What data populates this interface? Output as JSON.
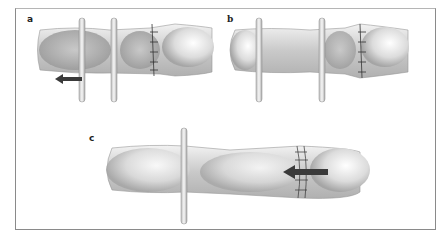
{
  "figure": {
    "panels": [
      {
        "id": "a",
        "label": "a",
        "description": "Finger with sutured junction at right; two vertical retractors on left; dark arrow pointing left"
      },
      {
        "id": "b",
        "label": "b",
        "description": "Finger with sutured junction at right; two vertical retractors holding tissue"
      },
      {
        "id": "c",
        "label": "c",
        "description": "Elongated finger with single retractor on left; sutured junction at right with dark arrow pointing left"
      }
    ],
    "colors": {
      "frame": "#8a8a8a",
      "tissue_light": "#e6e6e6",
      "tissue_dark": "#a8a8a8",
      "arrow": "#3a3a3a",
      "suture": "#333333"
    }
  }
}
